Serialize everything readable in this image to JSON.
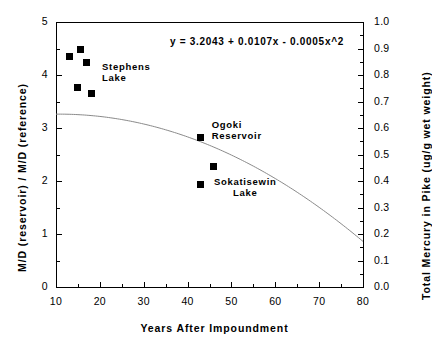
{
  "chart_data": {
    "type": "scatter",
    "title": "",
    "xlabel": "Years After Impoundment",
    "ylabel": "M/D (reservoir) / M/D (reference)",
    "ylabel_right": "Total Mercury in Pike (ug/g wet weight)",
    "xlim": [
      10,
      80
    ],
    "ylim": [
      0,
      5
    ],
    "ylim_right": [
      0.0,
      1.0
    ],
    "grid": false,
    "legend": "none",
    "xticks": [
      10,
      20,
      30,
      40,
      50,
      60,
      70,
      80
    ],
    "xticklabels": [
      "10",
      "20",
      "30",
      "40",
      "50",
      "60",
      "70",
      "80"
    ],
    "yticks": [
      0,
      1,
      2,
      3,
      4,
      5
    ],
    "yticklabels": [
      "0",
      "1",
      "2",
      "3",
      "4",
      "5"
    ],
    "yticks_right": [
      0.0,
      0.1,
      0.2,
      0.3,
      0.4,
      0.5,
      0.6,
      0.7,
      0.8,
      0.9,
      1.0
    ],
    "yticklabels_right": [
      "0.0",
      "0.1",
      "0.2",
      "0.3",
      "0.4",
      "0.5",
      "0.6",
      "0.7",
      "0.8",
      "0.9",
      "1.0"
    ],
    "annotations": [
      {
        "name": "fit-equation",
        "text": "y  =  3.2043  +  0.0107x  -  0.0005x^2",
        "x": 36,
        "y": 4.62
      },
      {
        "name": "stephens-lake-label",
        "line1": "Stephens",
        "line2": "Lake",
        "x": 20.5,
        "y": 4.15
      },
      {
        "name": "ogoki-reservoir-label",
        "line1": "Ogoki",
        "line2": "Reservoir",
        "x": 45.5,
        "y": 3.05
      },
      {
        "name": "sokatisewin-lake-label",
        "line1": "Sokatisewin",
        "line2": "Lake",
        "x": 46,
        "y": 1.98
      }
    ],
    "series": [
      {
        "name": "Reservoirs",
        "marker": "square",
        "color": "#000000",
        "points": [
          {
            "x": 13.0,
            "y": 4.35,
            "group": "Stephens Lake"
          },
          {
            "x": 15.5,
            "y": 4.48,
            "group": "Stephens Lake"
          },
          {
            "x": 17.0,
            "y": 4.23,
            "group": "Stephens Lake"
          },
          {
            "x": 15.0,
            "y": 3.76,
            "group": "Stephens Lake"
          },
          {
            "x": 18.0,
            "y": 3.66,
            "group": "Stephens Lake"
          },
          {
            "x": 43.0,
            "y": 2.83,
            "group": "Ogoki Reservoir"
          },
          {
            "x": 46.0,
            "y": 2.28,
            "group": ""
          },
          {
            "x": 43.0,
            "y": 1.94,
            "group": "Sokatisewin Lake"
          }
        ]
      }
    ],
    "fit_curve": {
      "name": "quadratic-regression",
      "equation": "y = 3.2043 + 0.0107x - 0.0005x^2",
      "intercept": 3.2043,
      "linear_coef": 0.0107,
      "quadratic_coef": -0.0005,
      "color": "#8a8a8a",
      "x_start": 10,
      "x_end": 80
    }
  }
}
